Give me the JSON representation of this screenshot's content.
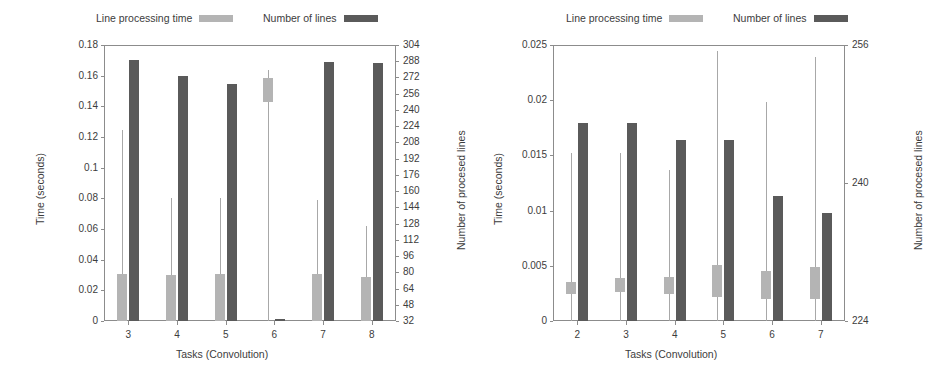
{
  "legend": {
    "entries": [
      {
        "label": "Line processing time",
        "color": "#b4b4b4",
        "icon": "legend-swatch-light"
      },
      {
        "label": "Number of lines",
        "color": "#5a5a5a",
        "icon": "legend-swatch-dark"
      }
    ]
  },
  "chart_data": [
    {
      "id": "left",
      "type": "bar",
      "title": "",
      "xlabel": "Tasks (Convolution)",
      "ylabel": "Time (seconds)",
      "y2label": "Number of procesed lines",
      "categories": [
        "3",
        "4",
        "5",
        "6",
        "7",
        "8"
      ],
      "ylim": [
        0,
        0.18
      ],
      "yticks": [
        "0",
        "0.02",
        "0.04",
        "0.06",
        "0.08",
        "0.1",
        "0.12",
        "0.14",
        "0.16",
        "0.18"
      ],
      "y2lim": [
        32,
        304
      ],
      "y2ticks": [
        "32",
        "48",
        "64",
        "80",
        "96",
        "112",
        "128",
        "144",
        "160",
        "176",
        "192",
        "208",
        "224",
        "240",
        "256",
        "272",
        "288",
        "304"
      ],
      "grid": false,
      "legend_position": "top",
      "series": [
        {
          "name": "Line processing time",
          "axis": "left",
          "color": "#b4b4b4",
          "box_low": [
            0.0,
            0.0,
            0.0,
            0.1425,
            0.0,
            0.0
          ],
          "box_high": [
            0.0305,
            0.03,
            0.0305,
            0.1585,
            0.0305,
            0.0288
          ],
          "whisker_high": [
            0.1245,
            0.08,
            0.08,
            0.164,
            0.079,
            0.062
          ],
          "whisker_low": [
            0.0,
            0.0,
            0.0,
            0.135,
            0.0,
            0.0
          ]
        },
        {
          "name": "Number of lines",
          "axis": "right",
          "color": "#5a5a5a",
          "values": [
            289,
            273,
            266,
            34,
            287,
            286
          ]
        }
      ]
    },
    {
      "id": "right",
      "type": "bar",
      "title": "",
      "xlabel": "Tasks (Convolution)",
      "ylabel": "Time (seconds)",
      "y2label": "Number of procesed lines",
      "categories": [
        "2",
        "3",
        "4",
        "5",
        "6",
        "7"
      ],
      "ylim": [
        0,
        0.025
      ],
      "yticks": [
        "0",
        "0.005",
        "0.01",
        "0.015",
        "0.02",
        "0.025"
      ],
      "y2lim": [
        224,
        256
      ],
      "y2ticks": [
        "224",
        "240",
        "256"
      ],
      "grid": false,
      "legend_position": "top",
      "series": [
        {
          "name": "Line processing time",
          "axis": "left",
          "color": "#b4b4b4",
          "box_low": [
            0.00245,
            0.00265,
            0.00245,
            0.00215,
            0.00195,
            0.00195
          ],
          "box_high": [
            0.00355,
            0.0039,
            0.004,
            0.00505,
            0.00455,
            0.0049
          ],
          "whisker_high": [
            0.0152,
            0.0152,
            0.0137,
            0.0245,
            0.0198,
            0.0239
          ],
          "whisker_low": [
            0.00245,
            0.00265,
            0.00245,
            0.00215,
            0.00195,
            0.00195
          ]
        },
        {
          "name": "Number of lines",
          "axis": "right",
          "color": "#5a5a5a",
          "values": [
            247.0,
            247.0,
            245.0,
            245.0,
            238.5,
            236.5
          ]
        }
      ]
    }
  ]
}
